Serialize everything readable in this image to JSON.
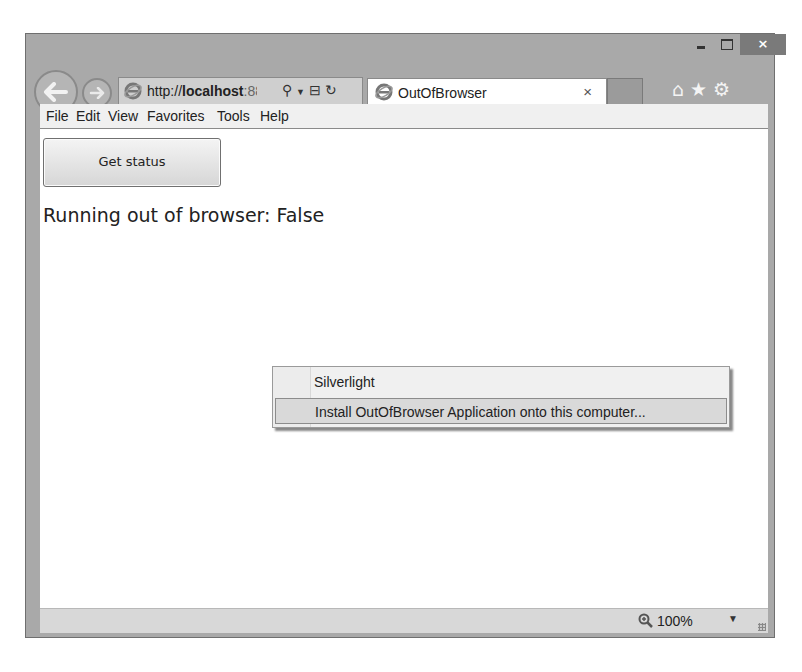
{
  "window": {
    "caption_buttons": {
      "minimize": "–",
      "maximize": "□",
      "close": "×"
    }
  },
  "navigation": {
    "back_icon": "arrow-left",
    "forward_icon": "arrow-right"
  },
  "address_bar": {
    "url_prefix": "http://",
    "url_host": "localhost",
    "url_rest": ":88:",
    "tools": "⌕ ▾ ⊞ ↻"
  },
  "tab": {
    "title": "OutOfBrowser",
    "close": "×"
  },
  "toolbar_icons": "⌂★⚙",
  "menubar": {
    "items": [
      "File",
      "Edit",
      "View",
      "Favorites",
      "Tools",
      "Help"
    ]
  },
  "page": {
    "button_label": "Get status",
    "status_text": "Running out of browser: False"
  },
  "context_menu": {
    "items": [
      {
        "label": "Silverlight",
        "highlighted": false
      },
      {
        "label": "Install OutOfBrowser Application onto this computer...",
        "highlighted": true
      }
    ]
  },
  "statusbar": {
    "zoom_level": "100%",
    "zoom_dropdown": "▼"
  }
}
